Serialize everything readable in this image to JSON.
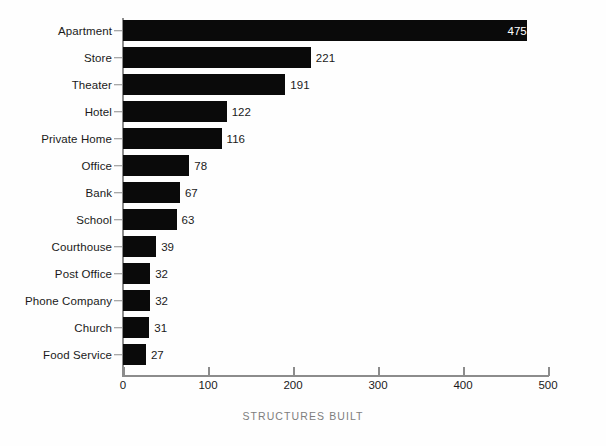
{
  "chart_data": {
    "type": "bar",
    "orientation": "horizontal",
    "title": "",
    "subtitle": "",
    "xlabel": "STRUCTURES BUILT",
    "ylabel": "",
    "xlim": [
      0,
      500
    ],
    "xticks": [
      0,
      100,
      200,
      300,
      400,
      500
    ],
    "xtick_labels": [
      "0",
      "100",
      "200",
      "300",
      "400",
      "500"
    ],
    "grid": false,
    "legend": null,
    "bar_color": "#0a0a0a",
    "axis_color": "#8c8c8c",
    "value_labels_shown": true,
    "categories": [
      "Apartment",
      "Store",
      "Theater",
      "Hotel",
      "Private Home",
      "Office",
      "Bank",
      "School",
      "Courthouse",
      "Post Office",
      "Phone Company",
      "Church",
      "Food Service"
    ],
    "values": [
      475,
      221,
      191,
      122,
      116,
      78,
      67,
      63,
      39,
      32,
      32,
      31,
      27
    ],
    "value_label_position": [
      "inside",
      "outside",
      "outside",
      "outside",
      "outside",
      "outside",
      "outside",
      "outside",
      "outside",
      "outside",
      "outside",
      "outside",
      "outside"
    ],
    "bars": [
      {
        "category": "Apartment",
        "value": 475,
        "label": "475",
        "label_position": "inside"
      },
      {
        "category": "Store",
        "value": 221,
        "label": "221",
        "label_position": "outside"
      },
      {
        "category": "Theater",
        "value": 191,
        "label": "191",
        "label_position": "outside"
      },
      {
        "category": "Hotel",
        "value": 122,
        "label": "122",
        "label_position": "outside"
      },
      {
        "category": "Private Home",
        "value": 116,
        "label": "116",
        "label_position": "outside"
      },
      {
        "category": "Office",
        "value": 78,
        "label": "78",
        "label_position": "outside"
      },
      {
        "category": "Bank",
        "value": 67,
        "label": "67",
        "label_position": "outside"
      },
      {
        "category": "School",
        "value": 63,
        "label": "63",
        "label_position": "outside"
      },
      {
        "category": "Courthouse",
        "value": 39,
        "label": "39",
        "label_position": "outside"
      },
      {
        "category": "Post Office",
        "value": 32,
        "label": "32",
        "label_position": "outside"
      },
      {
        "category": "Phone Company",
        "value": 32,
        "label": "32",
        "label_position": "outside"
      },
      {
        "category": "Church",
        "value": 31,
        "label": "31",
        "label_position": "outside"
      },
      {
        "category": "Food Service",
        "value": 27,
        "label": "27",
        "label_position": "outside"
      }
    ]
  }
}
